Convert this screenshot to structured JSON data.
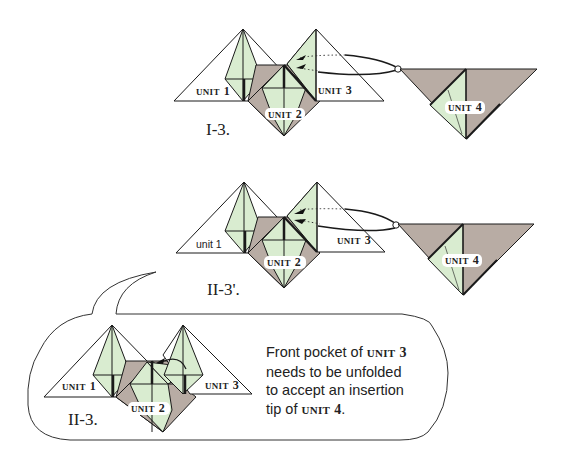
{
  "colors": {
    "paper_white": "#ffffff",
    "paper_green": "#d9ecd0",
    "paper_gray": "#b8aca4",
    "line": "#1a1a1a"
  },
  "figure_I3": {
    "step_label": "I-3.",
    "unit1": {
      "word": "UNIT",
      "num": "1"
    },
    "unit2": {
      "word": "UNIT",
      "num": "2"
    },
    "unit3": {
      "word": "UNIT",
      "num": "3"
    },
    "unit4": {
      "word": "UNIT",
      "num": "4"
    }
  },
  "figure_II3p": {
    "step_label": "II-3'.",
    "unit1": {
      "text": "unit 1"
    },
    "unit2": {
      "word": "UNIT",
      "num": "2"
    },
    "unit3": {
      "word": "UNIT",
      "num": "3"
    },
    "unit4": {
      "word": "UNIT",
      "num": "4"
    }
  },
  "figure_II3": {
    "step_label": "II-3.",
    "unit1": {
      "word": "UNIT",
      "num": "1"
    },
    "unit2": {
      "word": "UNIT",
      "num": "2"
    },
    "unit3": {
      "word": "UNIT",
      "num": "3"
    }
  },
  "note": {
    "line1_pre": "Front pocket of ",
    "line1_unit": "UNIT",
    "line1_num": "3",
    "line2": "needs to be unfolded",
    "line3": "to accept an insertion",
    "line4_pre": "tip of ",
    "line4_unit": "UNIT",
    "line4_num": "4",
    "line4_post": "."
  }
}
